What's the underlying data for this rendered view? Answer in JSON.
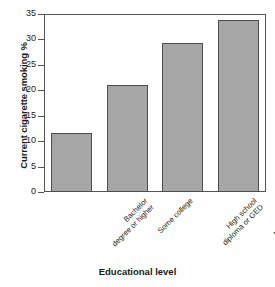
{
  "chart_data": {
    "type": "bar",
    "title": "",
    "xlabel": "Educational level",
    "ylabel": "Current cigarette smoking %",
    "categories": [
      "Bachelor degree or higher",
      "Some college",
      "High school diploma or GED",
      "No high school diploma or GED"
    ],
    "category_lines": [
      [
        "Bachelor",
        "degree or higher"
      ],
      [
        "Some college"
      ],
      [
        "High school",
        "diploma or GED"
      ],
      [
        "No high school",
        "diploma or GED"
      ]
    ],
    "values": [
      11.6,
      21.0,
      29.2,
      33.8
    ],
    "ylim": [
      0,
      35
    ],
    "ytick_values": [
      0,
      5,
      10,
      15,
      20,
      25,
      30,
      35
    ],
    "ytick_labels": [
      "0",
      "5",
      "10",
      "15",
      "20",
      "25",
      "30",
      "35"
    ],
    "grid": false,
    "legend": null,
    "bar_fill_color": "#a6a6a6",
    "bar_edge_color": "#4d4d4d",
    "axis_color": "#555555",
    "text_color": "#1a1a1a",
    "background_color": "#ffffff"
  }
}
